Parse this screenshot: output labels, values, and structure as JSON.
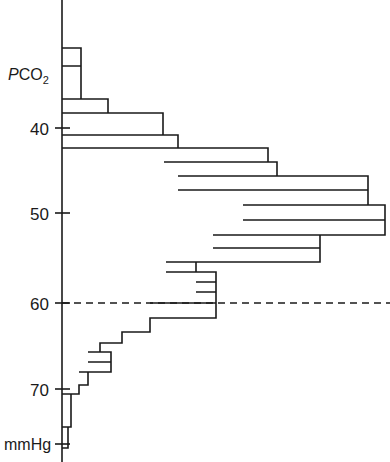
{
  "chart_data": {
    "type": "bar",
    "orientation": "horizontal",
    "title": "",
    "xlabel": "",
    "ylabel": "PCO2",
    "units_label": "mmHg",
    "grid": false,
    "legend": null,
    "axis_x_position_px": 62,
    "y_axis_inverted": true,
    "ylim": [
      33.5,
      75.5
    ],
    "y_tick_labels": [
      "40",
      "50",
      "60",
      "70"
    ],
    "y_ticks": [
      40,
      50,
      60,
      70
    ],
    "y_tick_pixels": [
      128,
      213,
      303,
      389
    ],
    "reference_line": {
      "value": 60,
      "style": "dashed",
      "pixel_y": 303,
      "spans_full_width": true
    },
    "categories": [
      36,
      37,
      38,
      39,
      40,
      41,
      42,
      43,
      44,
      45,
      46,
      47,
      48,
      49,
      50,
      51,
      52,
      53,
      54,
      55,
      56,
      57,
      58,
      59,
      60,
      61,
      62,
      63,
      64,
      65,
      66,
      67,
      68,
      69,
      70,
      71,
      72,
      73,
      74
    ],
    "bar_spans_px": [
      {
        "pco2": 36.5,
        "y_top": 48,
        "y_bottom": 66,
        "x_left": 62,
        "x_right": 81
      },
      {
        "pco2": 38.5,
        "y_top": 66,
        "y_bottom": 99,
        "x_left": 62,
        "x_right": 81
      },
      {
        "pco2": 40.0,
        "y_top": 99,
        "y_bottom": 113,
        "x_left": 62,
        "x_right": 108
      },
      {
        "pco2": 41.5,
        "y_top": 113,
        "y_bottom": 135,
        "x_left": 62,
        "x_right": 163
      },
      {
        "pco2": 42.8,
        "y_top": 135,
        "y_bottom": 148,
        "x_left": 62,
        "x_right": 178
      },
      {
        "pco2": 43.8,
        "y_top": 148,
        "y_bottom": 162,
        "x_left": 164,
        "x_right": 268
      },
      {
        "pco2": 45.0,
        "y_top": 162,
        "y_bottom": 176,
        "x_left": 178,
        "x_right": 277
      },
      {
        "pco2": 46.5,
        "y_top": 176,
        "y_bottom": 190,
        "x_left": 178,
        "x_right": 368
      },
      {
        "pco2": 48.0,
        "y_top": 190,
        "y_bottom": 205,
        "x_left": 243,
        "x_right": 368
      },
      {
        "pco2": 49.5,
        "y_top": 205,
        "y_bottom": 220,
        "x_left": 243,
        "x_right": 385
      },
      {
        "pco2": 51.0,
        "y_top": 220,
        "y_bottom": 235,
        "x_left": 213,
        "x_right": 385
      },
      {
        "pco2": 52.5,
        "y_top": 235,
        "y_bottom": 248,
        "x_left": 213,
        "x_right": 320
      },
      {
        "pco2": 54.0,
        "y_top": 248,
        "y_bottom": 262,
        "x_left": 166,
        "x_right": 320
      },
      {
        "pco2": 55.5,
        "y_top": 262,
        "y_bottom": 272,
        "x_left": 166,
        "x_right": 196
      },
      {
        "pco2": 56.5,
        "y_top": 272,
        "y_bottom": 282,
        "x_left": 196,
        "x_right": 216
      },
      {
        "pco2": 57.5,
        "y_top": 282,
        "y_bottom": 292,
        "x_left": 196,
        "x_right": 216
      },
      {
        "pco2": 58.7,
        "y_top": 292,
        "y_bottom": 303,
        "x_left": 150,
        "x_right": 216
      },
      {
        "pco2": 60.5,
        "y_top": 303,
        "y_bottom": 318,
        "x_left": 150,
        "x_right": 216
      },
      {
        "pco2": 62.0,
        "y_top": 318,
        "y_bottom": 332,
        "x_left": 122,
        "x_right": 150
      },
      {
        "pco2": 63.5,
        "y_top": 332,
        "y_bottom": 343,
        "x_left": 100,
        "x_right": 122
      },
      {
        "pco2": 64.5,
        "y_top": 343,
        "y_bottom": 352,
        "x_left": 88,
        "x_right": 100
      },
      {
        "pco2": 65.5,
        "y_top": 352,
        "y_bottom": 362,
        "x_left": 88,
        "x_right": 111
      },
      {
        "pco2": 66.5,
        "y_top": 362,
        "y_bottom": 372,
        "x_left": 79,
        "x_right": 111
      },
      {
        "pco2": 68.5,
        "y_top": 372,
        "y_bottom": 385,
        "x_left": 79,
        "x_right": 88
      },
      {
        "pco2": 70.0,
        "y_top": 385,
        "y_bottom": 394,
        "x_left": 62,
        "x_right": 79
      },
      {
        "pco2": 72.5,
        "y_top": 394,
        "y_bottom": 427,
        "x_left": 62,
        "x_right": 71
      },
      {
        "pco2": 74.5,
        "y_top": 427,
        "y_bottom": 448,
        "x_left": 62,
        "x_right": 68
      }
    ],
    "outline_path": "M62,48 L81,48 L81,99 L108,99 L108,113 L163,113 L163,135 L178,135 L178,148 L164,148 L164,162 L268,162 L268,148 L178,148 M178,162 L178,176 L277,176 L277,162 L268,162 M178,176 L368,176 L368,190 L243,190 L243,205 L368,205 L368,190 M243,205 L385,205 L385,220 L213,220 L213,235 L385,235 L385,220 M213,235 L320,235 L320,248 L166,248 L166,262 L320,262 L320,248 M166,262 L196,262 L196,272 L216,272 L216,282 L196,282 L196,292 L216,292 L216,303 L150,303 L150,318 L216,318 L216,303 M150,318 L122,318 L122,332 L100,332 L100,343 L88,343 L88,352 L111,352 L111,362 L79,362 L79,372 L88,372 L88,385 L79,385 L79,394 L71,394 L71,427 L68,427 L68,448 L62,448",
    "note": "Horizontal step-histogram (frequency distribution) of arterial PCO2; counts extend rightward from the vertical axis; dashed reference line at 60 mmHg"
  },
  "labels": {
    "y_axis_title_main": "P",
    "y_axis_title_rest": "CO",
    "y_axis_title_sub": "2",
    "units": "mmHg",
    "tick_40": "40",
    "tick_50": "50",
    "tick_60": "60",
    "tick_70": "70"
  },
  "colors": {
    "ink": "#1a1a1a",
    "background": "#ffffff"
  }
}
